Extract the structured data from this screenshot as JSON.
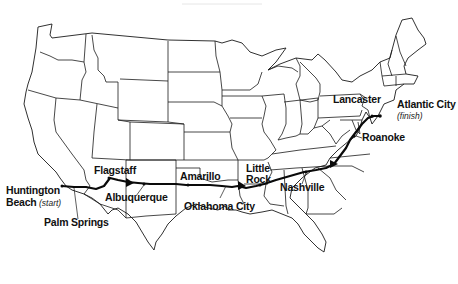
{
  "map": {
    "title": "Cross-country route map",
    "region": "Contiguous United States",
    "route": {
      "start": "Huntington Beach",
      "finish": "Atlantic City",
      "stops": [
        {
          "name": "Huntington Beach",
          "note": "(start)"
        },
        {
          "name": "Palm Springs",
          "note": ""
        },
        {
          "name": "Flagstaff",
          "note": ""
        },
        {
          "name": "Albuquerque",
          "note": ""
        },
        {
          "name": "Amarillo",
          "note": ""
        },
        {
          "name": "Oklahoma City",
          "note": ""
        },
        {
          "name": "Little Rock",
          "note": ""
        },
        {
          "name": "Nashville",
          "note": ""
        },
        {
          "name": "Roanoke",
          "note": ""
        },
        {
          "name": "Lancaster",
          "note": ""
        },
        {
          "name": "Atlantic City",
          "note": "(finish)"
        }
      ]
    },
    "labels": {
      "huntington_1": "Huntington",
      "huntington_2": "Beach",
      "start_note": "(start)",
      "palm_springs": "Palm Springs",
      "flagstaff": "Flagstaff",
      "albuquerque": "Albuquerque",
      "amarillo": "Amarillo",
      "oklahoma_city": "Oklahoma City",
      "little_1": "Little",
      "little_2": "Rock",
      "nashville": "Nashville",
      "roanoke": "Roanoke",
      "lancaster": "Lancaster",
      "atlantic_city": "Atlantic City",
      "finish_note": "(finish)"
    },
    "colors": {
      "ink": "#111111",
      "background": "#ffffff"
    }
  }
}
